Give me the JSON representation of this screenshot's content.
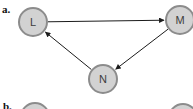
{
  "diagram": {
    "section_a_label": "a.",
    "section_b_label": "b.",
    "colors": {
      "background": "#ffffff",
      "node_fill": "#d2d2d2",
      "node_border": "#8c8c8c",
      "edge": "#1b1b1b",
      "node_label": "#3d3d3d",
      "section_label": "#111111"
    },
    "nodes": [
      {
        "id": "L",
        "label": "L",
        "x": 33,
        "y": 22,
        "r": 14
      },
      {
        "id": "M",
        "label": "M",
        "x": 180,
        "y": 20,
        "r": 14
      },
      {
        "id": "N",
        "label": "N",
        "x": 103,
        "y": 79,
        "r": 14
      }
    ],
    "edges": [
      {
        "from": "L",
        "to": "M"
      },
      {
        "from": "M",
        "to": "N"
      },
      {
        "from": "N",
        "to": "L"
      }
    ],
    "partial_nodes_b": [
      {
        "id": "b-left",
        "label": "",
        "x": 35,
        "y": 117,
        "r": 14
      },
      {
        "id": "b-right",
        "label": "",
        "x": 183,
        "y": 118,
        "r": 14
      }
    ]
  }
}
